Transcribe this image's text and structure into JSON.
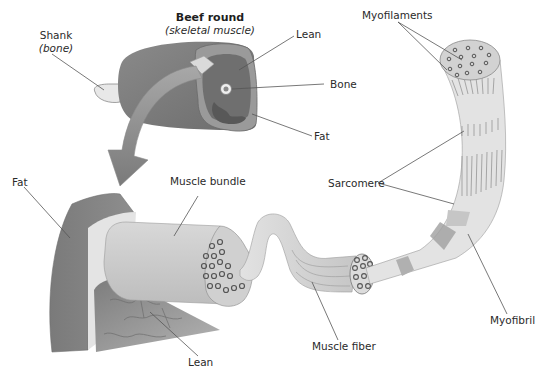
{
  "diagram": {
    "type": "anatomical-illustration",
    "colors": {
      "background": "#ffffff",
      "muscle_dark": "#7f7f7f",
      "muscle_mid": "#9a9a9a",
      "lean_face": "#6e6e6e",
      "fat_light": "#d9d9d9",
      "bundle_light": "#cfcfcf",
      "fiber_light": "#d6d6d6",
      "leader_line": "#555555",
      "arrow": "#8c8c8c"
    }
  },
  "labels": {
    "beef_round_title": "Beef round",
    "beef_round_subtitle": "(skeletal muscle)",
    "shank": "Shank",
    "shank_sub": "(bone)",
    "lean_top": "Lean",
    "bone": "Bone",
    "fat_top": "Fat",
    "myofilaments": "Myofilaments",
    "sarcomere": "Sarcomere",
    "fat_left": "Fat",
    "muscle_bundle": "Muscle bundle",
    "lean_bottom": "Lean",
    "muscle_fiber": "Muscle fiber",
    "myofibril": "Myofibril"
  }
}
